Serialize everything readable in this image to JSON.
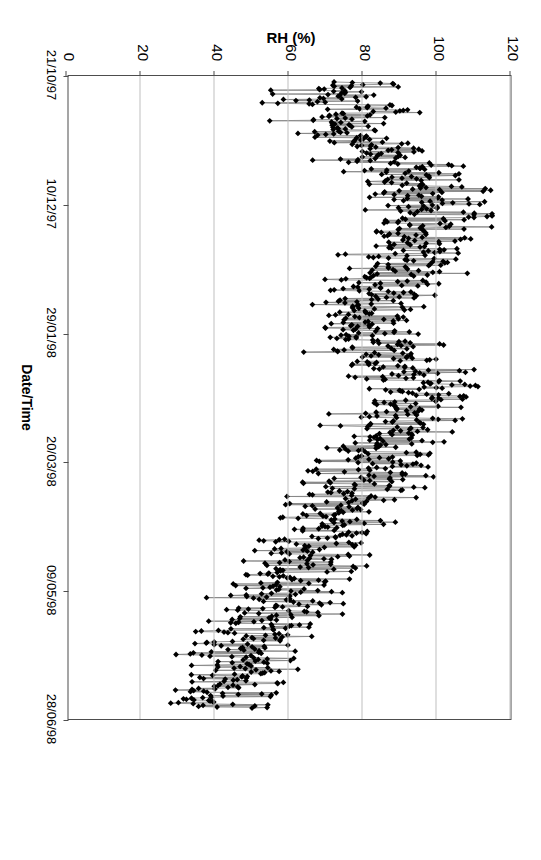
{
  "chart_data": {
    "type": "line",
    "title": "",
    "xlabel": "Date/Time",
    "ylabel": "RH (%)",
    "ylim": [
      0,
      120
    ],
    "ytick_labels": [
      "0",
      "20",
      "40",
      "60",
      "80",
      "100",
      "120"
    ],
    "ytick_values": [
      0,
      20,
      40,
      60,
      80,
      100,
      120
    ],
    "xtick_labels": [
      "21/10/97",
      "10/12/97",
      "29/01/98",
      "20/03/98",
      "09/05/98",
      "28/06/98"
    ],
    "grid": "horizontal-gridlines-at-each-20-percent",
    "legend": "none",
    "marker": "filled-black-diamond",
    "line_color": "#808080",
    "marker_color": "#000000",
    "axis_color": "#4d4d4d",
    "grid_color": "#bfbfbf",
    "series": [
      {
        "name": "RH (%)",
        "x_start_label": "21/10/97",
        "x_end_label": "28/06/98",
        "values": [
          81,
          83,
          74,
          78,
          70,
          64,
          71,
          68,
          79,
          77,
          70,
          69,
          60,
          68,
          77,
          80,
          84,
          92,
          85,
          80,
          74,
          78,
          72,
          66,
          77,
          80,
          83,
          81,
          78,
          72,
          68,
          62,
          70,
          73,
          80,
          86,
          83,
          78,
          74,
          79,
          83,
          88,
          92,
          95,
          90,
          86,
          82,
          78,
          84,
          89,
          94,
          98,
          95,
          90,
          86,
          91,
          95,
          100,
          97,
          93,
          88,
          84,
          90,
          95,
          99,
          103,
          100,
          96,
          92,
          88,
          93,
          97,
          101,
          105,
          102,
          98,
          94,
          90,
          95,
          99,
          103,
          107,
          104,
          100,
          96,
          92,
          97,
          101,
          104,
          100,
          96,
          91,
          87,
          93,
          98,
          102,
          99,
          95,
          90,
          86,
          92,
          96,
          100,
          97,
          93,
          88,
          84,
          89,
          94,
          98,
          95,
          91,
          86,
          82,
          87,
          92,
          96,
          93,
          89,
          84,
          80,
          85,
          90,
          94,
          91,
          87,
          82,
          78,
          83,
          88,
          92,
          89,
          85,
          80,
          76,
          81,
          86,
          90,
          87,
          83,
          78,
          74,
          79,
          84,
          88,
          85,
          81,
          76,
          72,
          77,
          82,
          87,
          91,
          88,
          84,
          79,
          75,
          80,
          85,
          90,
          94,
          91,
          87,
          82,
          78,
          83,
          88,
          93,
          97,
          94,
          90,
          85,
          81,
          86,
          91,
          96,
          100,
          97,
          93,
          88,
          84,
          89,
          94,
          99,
          103,
          100,
          96,
          91,
          87,
          92,
          97,
          101,
          98,
          94,
          89,
          85,
          90,
          95,
          99,
          96,
          92,
          87,
          83,
          88,
          93,
          97,
          94,
          90,
          85,
          81,
          86,
          91,
          95,
          92,
          88,
          83,
          79,
          84,
          89,
          93,
          90,
          86,
          81,
          77,
          82,
          87,
          91,
          88,
          84,
          79,
          75,
          80,
          85,
          89,
          86,
          82,
          77,
          73,
          78,
          83,
          87,
          84,
          80,
          75,
          71,
          76,
          81,
          85,
          82,
          78,
          73,
          69,
          74,
          79,
          83,
          80,
          76,
          71,
          67,
          72,
          77,
          81,
          78,
          74,
          69,
          65,
          70,
          75,
          79,
          76,
          72,
          67,
          63,
          68,
          73,
          77,
          74,
          70,
          65,
          61,
          66,
          71,
          75,
          72,
          68,
          63,
          59,
          64,
          69,
          73,
          70,
          66,
          61,
          57,
          62,
          67,
          71,
          68,
          64,
          59,
          55,
          60,
          65,
          69,
          66,
          62,
          57,
          53,
          58,
          63,
          67,
          64,
          60,
          55,
          51,
          56,
          61,
          65,
          62,
          58,
          53,
          49,
          54,
          59,
          63,
          60,
          56,
          51,
          47,
          52,
          57,
          61,
          58,
          54,
          49,
          45,
          50,
          55,
          59,
          56,
          52,
          47,
          43,
          48,
          53,
          57,
          54,
          50,
          45,
          41,
          46,
          51,
          55,
          52,
          48,
          43,
          39,
          44,
          49,
          53,
          50,
          46,
          41,
          37,
          42,
          47,
          51,
          48,
          44,
          39,
          35,
          40,
          45,
          49,
          46,
          42,
          37,
          33,
          38,
          43,
          47,
          44
        ]
      }
    ]
  },
  "axes": {
    "value_axis": {
      "title": "RH (%)",
      "ticks": [
        "0",
        "20",
        "40",
        "60",
        "80",
        "100",
        "120"
      ]
    },
    "category_axis": {
      "title": "Date/Time",
      "ticks": [
        "21/10/97",
        "10/12/97",
        "29/01/98",
        "20/03/98",
        "09/05/98",
        "28/06/98"
      ]
    }
  }
}
